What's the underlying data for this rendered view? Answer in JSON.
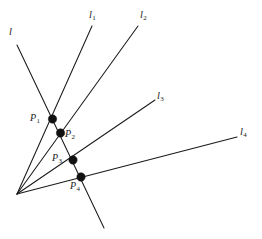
{
  "figure": {
    "background_color": "#ffffff",
    "stroke_color": "#1a1a1a",
    "point_color": "#111111",
    "width": 262,
    "height": 239,
    "apex": {
      "x": 17,
      "y": 194
    }
  },
  "line_labels": [
    {
      "id": "l",
      "base": "l",
      "sub": "",
      "x": 9,
      "y": 27
    },
    {
      "id": "l1",
      "base": "l",
      "sub": "1",
      "x": 89,
      "y": 10
    },
    {
      "id": "l2",
      "base": "l",
      "sub": "2",
      "x": 140,
      "y": 10
    },
    {
      "id": "l3",
      "base": "l",
      "sub": "3",
      "x": 157,
      "y": 91
    },
    {
      "id": "l4",
      "base": "l",
      "sub": "4",
      "x": 240,
      "y": 127
    }
  ],
  "point_labels": [
    {
      "id": "P1",
      "base": "P",
      "sub": "1",
      "x": 30,
      "y": 113
    },
    {
      "id": "P2",
      "base": "P",
      "sub": "2",
      "x": 65,
      "y": 129
    },
    {
      "id": "P3",
      "base": "P",
      "sub": "3",
      "x": 52,
      "y": 153
    },
    {
      "id": "P4",
      "base": "P",
      "sub": "4",
      "x": 70,
      "y": 181
    }
  ],
  "geometry": {
    "rays": [
      {
        "id": "l1",
        "x1": 17,
        "y1": 194,
        "x2": 92,
        "y2": 26
      },
      {
        "id": "l2",
        "x1": 17,
        "y1": 194,
        "x2": 138,
        "y2": 26
      },
      {
        "id": "l3",
        "x1": 17,
        "y1": 194,
        "x2": 155,
        "y2": 100
      },
      {
        "id": "l4",
        "x1": 17,
        "y1": 194,
        "x2": 237,
        "y2": 137
      }
    ],
    "transversal": {
      "id": "l",
      "x1": 17,
      "y1": 45,
      "x2": 104,
      "y2": 228
    },
    "points": [
      {
        "id": "P1",
        "x": 52.5,
        "y": 119,
        "r": 4.2
      },
      {
        "id": "P2",
        "x": 60.5,
        "y": 133,
        "r": 4.2
      },
      {
        "id": "P3",
        "x": 73,
        "y": 160,
        "r": 4.2
      },
      {
        "id": "P4",
        "x": 81,
        "y": 177,
        "r": 4.2
      }
    ]
  }
}
